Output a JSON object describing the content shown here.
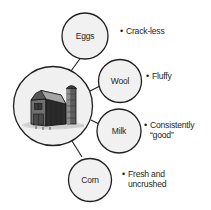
{
  "diagram": {
    "type": "hub-and-spoke",
    "hub": {
      "name": "farm-barn",
      "icon": "barn-illustration",
      "caption": ""
    },
    "colors": {
      "circle_fill": "#f1f1f1",
      "circle_stroke": "#231f20",
      "text": "#231f20",
      "hub_fill": "#eeeeee",
      "background": "#ffffff"
    },
    "nodes": [
      {
        "id": "eggs",
        "label": "Eggs",
        "bullet": "•",
        "attribute": "Crack-less"
      },
      {
        "id": "wool",
        "label": "Wool",
        "bullet": "•",
        "attribute": "Fluffy"
      },
      {
        "id": "milk",
        "label": "Milk",
        "bullet": "•",
        "attribute": "Consistently\n“good”"
      },
      {
        "id": "corn",
        "label": "Corn",
        "bullet": "•",
        "attribute": "Fresh and\nuncrushed"
      }
    ]
  }
}
